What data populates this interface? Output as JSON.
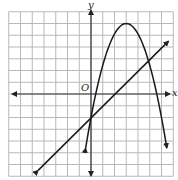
{
  "chart_data": {
    "type": "line",
    "title": "",
    "xlabel": "x",
    "ylabel": "y",
    "origin_label": "O",
    "grid": true,
    "xlim": [
      -7,
      7
    ],
    "ylim": [
      -7,
      7
    ],
    "series": [
      {
        "name": "parabola",
        "kind": "quadratic",
        "vertex": [
          3,
          6
        ],
        "points": [
          [
            -0.2,
            -4.5
          ],
          [
            0,
            -2
          ],
          [
            1,
            2.2
          ],
          [
            2,
            5
          ],
          [
            3,
            6
          ],
          [
            4,
            5
          ],
          [
            5,
            2.2
          ],
          [
            6,
            -2
          ],
          [
            6.2,
            -4.5
          ]
        ]
      },
      {
        "name": "line",
        "kind": "linear",
        "slope": 1,
        "intercept": -2,
        "points": [
          [
            -4.5,
            -6.5
          ],
          [
            6.6,
            4.5
          ]
        ]
      }
    ]
  },
  "labels": {
    "x_axis": "x",
    "y_axis": "y",
    "origin": "O"
  },
  "colors": {
    "grid": "#b8b8b8",
    "axis": "#333333",
    "curve": "#1a1a1a"
  }
}
